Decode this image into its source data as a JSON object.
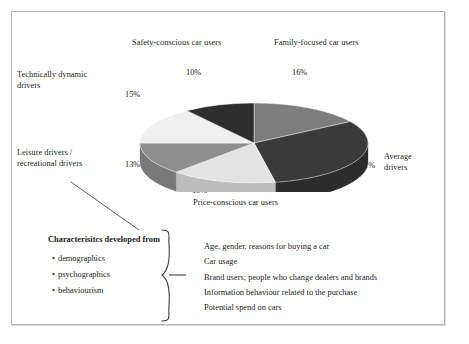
{
  "figure": {
    "frame_color": "#b6b6b6",
    "background": "#ffffff"
  },
  "chart_data": {
    "type": "pie",
    "title": "",
    "three_d": true,
    "legend_position": "callout-labels",
    "categories": [
      "Family-focused car users",
      "Average drivers",
      "Price-conscious car users",
      "Leisure drivers / recreational drivers",
      "Technically dynamic drivers",
      "Safety-conscious car users"
    ],
    "values": [
      16,
      31,
      15,
      13,
      15,
      10
    ],
    "value_labels": [
      "16%",
      "31%",
      "15%",
      "13%",
      "15%",
      "10%"
    ],
    "colors": [
      "#7d7d7d",
      "#3a3a3a",
      "#e3e3e3",
      "#8e8e8e",
      "#efefef",
      "#2e2e2e"
    ],
    "side_colors": [
      "#6a6a6a",
      "#2c2c2c",
      "#bcbcbc",
      "#787878",
      "#c7c7c7",
      "#242424"
    ],
    "units": "percent of car users",
    "total": 100
  },
  "callouts": {
    "top_left": {
      "label": "Safety-conscious car users",
      "value": "10%"
    },
    "top_right": {
      "label": "Family-focused car users",
      "value": "16%"
    },
    "left_upper": {
      "label": "Technically dynamic\ndrivers",
      "value": "15%"
    },
    "left_lower": {
      "label": "Leisure drivers /\nrecreational drivers",
      "value": "13%"
    },
    "right": {
      "label": "Average\ndrivers",
      "value": "31%"
    },
    "bottom": {
      "label": "Price-conscious car users",
      "value": "15%"
    }
  },
  "characteristics": {
    "title": "Characterisitcs developed from",
    "bullet_glyph": "•",
    "items": [
      "demographics",
      "psychographics",
      "behaviourism"
    ]
  },
  "details": {
    "items": [
      "Age, gender, reasons for buying a car",
      "Car usage",
      "Brand users; people who change dealers and brands",
      "Information behaviour related to the purchase",
      "Potential spend on cars"
    ]
  }
}
